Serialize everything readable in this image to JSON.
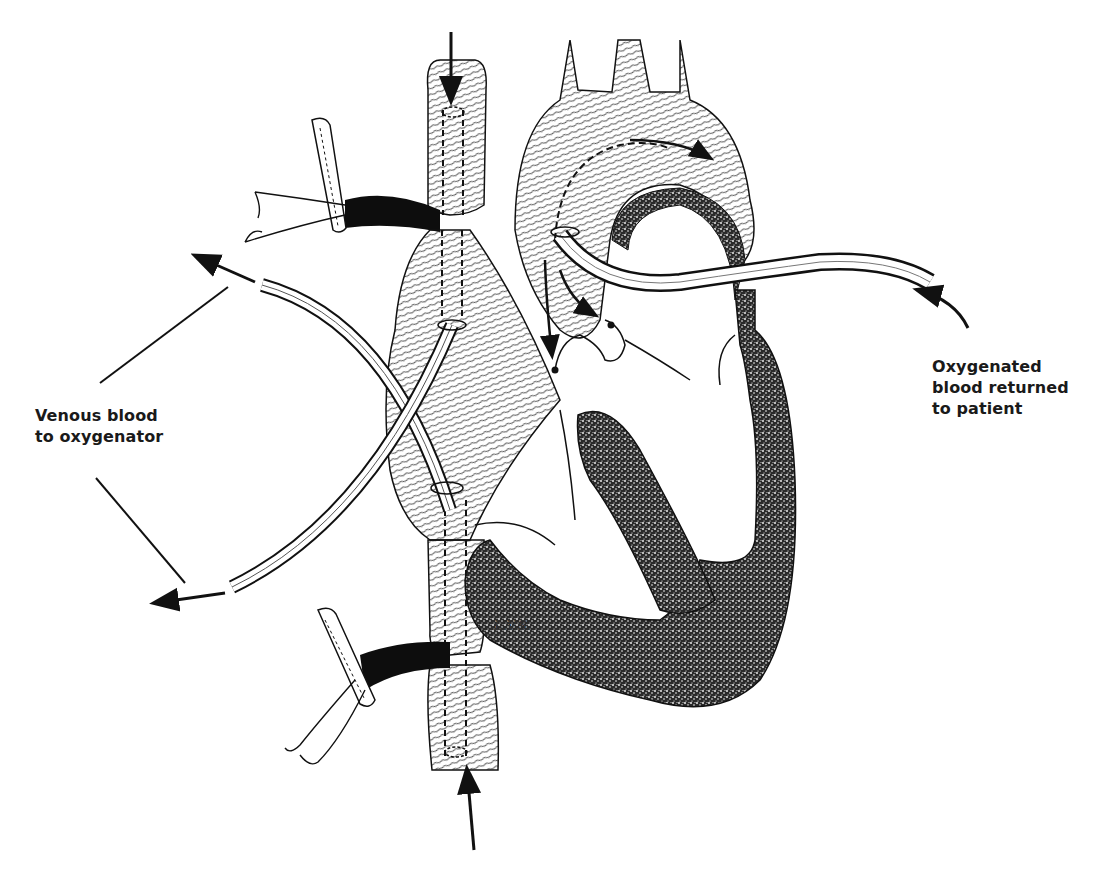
{
  "figure": {
    "labels": {
      "venous": {
        "line1": "Venous blood",
        "line2": "to oxygenator"
      },
      "arterial": {
        "line1": "Oxygenated",
        "line2": "blood returned",
        "line3": "to patient"
      }
    },
    "artist_signature": "L.V.S.",
    "colors": {
      "ink": "#111111",
      "paper": "#ffffff",
      "myocardium_stipple": "#3a3a3a"
    }
  }
}
